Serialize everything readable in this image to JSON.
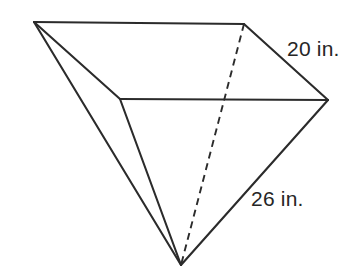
{
  "figure": {
    "kind": "geometry-diagram",
    "background_color": "#ffffff",
    "line_color": "#2b2b2b",
    "hidden_edge_style": "dashed",
    "vertices": {
      "top_left": {
        "x": 34,
        "y": 22
      },
      "top_right": {
        "x": 244,
        "y": 24
      },
      "mid_left": {
        "x": 120,
        "y": 99
      },
      "right": {
        "x": 328,
        "y": 100
      },
      "apex": {
        "x": 181,
        "y": 265
      }
    },
    "edges": [
      {
        "name": "top-back-edge",
        "from": "top_left",
        "to": "top_right",
        "style": "solid"
      },
      {
        "name": "top-right-slant-edge",
        "from": "top_right",
        "to": "right",
        "style": "solid"
      },
      {
        "name": "front-top-edge",
        "from": "mid_left",
        "to": "right",
        "style": "solid"
      },
      {
        "name": "left-slant-edge",
        "from": "top_left",
        "to": "mid_left",
        "style": "solid"
      },
      {
        "name": "back-left-lateral-edge",
        "from": "top_left",
        "to": "apex",
        "style": "solid"
      },
      {
        "name": "front-left-lateral-edge",
        "from": "mid_left",
        "to": "apex",
        "style": "solid"
      },
      {
        "name": "front-right-lateral-edge",
        "from": "right",
        "to": "apex",
        "style": "solid"
      },
      {
        "name": "hidden-back-lateral-edge",
        "from": "top_right",
        "to": "apex",
        "style": "dashed"
      }
    ]
  },
  "labels": {
    "slant_top_right": "20 in.",
    "lateral_front_right": "26 in."
  }
}
